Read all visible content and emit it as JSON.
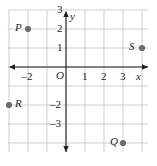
{
  "figure": {
    "kind": "coordinate-plane",
    "background": "#ffffff",
    "grid_color": "#b9b9b9",
    "axis_color": "#231f20",
    "point_color": "#6d6e71",
    "origin_label": "O"
  },
  "axes": {
    "x_label": "x",
    "y_label": "y",
    "x_ticks": [
      {
        "value": -2,
        "label": "–2"
      },
      {
        "value": 1,
        "label": "1"
      },
      {
        "value": 2,
        "label": "2"
      },
      {
        "value": 3,
        "label": "3"
      }
    ],
    "y_ticks": [
      {
        "value": 3,
        "label": "3"
      },
      {
        "value": 2,
        "label": "2"
      },
      {
        "value": 1,
        "label": "1"
      },
      {
        "value": -2,
        "label": "–2"
      },
      {
        "value": -3,
        "label": "–3"
      }
    ],
    "xlim": [
      -3.05,
      4.3
    ],
    "ylim": [
      -4.5,
      3.5
    ]
  },
  "chart_data": {
    "type": "scatter",
    "title": "",
    "xlabel": "x",
    "ylabel": "y",
    "xlim": [
      -3.05,
      4.3
    ],
    "ylim": [
      -4.5,
      3.5
    ],
    "grid": true,
    "legend": "none",
    "series": [
      {
        "name": "plotted points",
        "points": [
          {
            "label": "P",
            "x": -2,
            "y": 2,
            "label_side": "left"
          },
          {
            "label": "S",
            "x": 4,
            "y": 1,
            "label_side": "left"
          },
          {
            "label": "R",
            "x": -3,
            "y": -2,
            "label_side": "right"
          },
          {
            "label": "Q",
            "x": 3,
            "y": -4,
            "label_side": "left"
          }
        ]
      }
    ]
  }
}
